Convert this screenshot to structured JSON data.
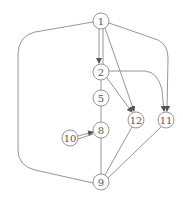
{
  "diagram": {
    "type": "directed-graph",
    "colors": {
      "stroke": "#8a8a8a",
      "node_fill": "#ffffff",
      "text": "#555555",
      "background": "#ffffff"
    },
    "node_radius": 8,
    "nodes": [
      {
        "id": "1",
        "label": "1",
        "x": 101,
        "y": 21
      },
      {
        "id": "2",
        "label": "2",
        "x": 101,
        "y": 72
      },
      {
        "id": "5",
        "label": "5",
        "x": 101,
        "y": 98
      },
      {
        "id": "8",
        "label": "8",
        "x": 101,
        "y": 130
      },
      {
        "id": "9",
        "label": "9",
        "x": 101,
        "y": 182
      },
      {
        "id": "10",
        "label": "10",
        "x": 70,
        "y": 138
      },
      {
        "id": "12",
        "label": "12",
        "x": 136,
        "y": 120
      },
      {
        "id": "11",
        "label": "11",
        "x": 166,
        "y": 120
      }
    ],
    "edges": [
      {
        "from": "1",
        "to": "2",
        "arrow": true,
        "path": "M99,29 L99,63"
      },
      {
        "from": "1",
        "to": "2",
        "arrow": false,
        "path": "M103,29 L103,64"
      },
      {
        "from": "1",
        "to": "12",
        "arrow": true,
        "path": "M105,28 L134,111"
      },
      {
        "from": "1",
        "to": "11",
        "arrow": true,
        "path": "M109,23 L158,40 Q168,45 168,58 L167,111"
      },
      {
        "from": "1",
        "to": "9",
        "arrow": false,
        "path": "M93,22 L35,32 Q18,36 18,55 L18,150 Q18,166 35,170 L93,183"
      },
      {
        "from": "2",
        "to": "12",
        "arrow": true,
        "path": "M107,78 L132,112"
      },
      {
        "from": "2",
        "to": "11",
        "arrow": true,
        "path": "M109,71 L145,71 Q158,72 162,90 L164,111"
      },
      {
        "from": "2",
        "to": "5",
        "arrow": false,
        "path": "M101,80 L101,90"
      },
      {
        "from": "5",
        "to": "8",
        "arrow": false,
        "path": "M101,106 L101,122"
      },
      {
        "from": "10",
        "to": "8",
        "arrow": true,
        "path": "M78,136 L93,132"
      },
      {
        "from": "10",
        "to": "8",
        "arrow": false,
        "path": "M78,139 L93,134"
      },
      {
        "from": "8",
        "to": "9",
        "arrow": false,
        "path": "M101,138 L101,174"
      },
      {
        "from": "12",
        "to": "9",
        "arrow": false,
        "path": "M132,127 L105,175"
      },
      {
        "from": "11",
        "to": "9",
        "arrow": false,
        "path": "M161,127 L108,178"
      }
    ]
  }
}
